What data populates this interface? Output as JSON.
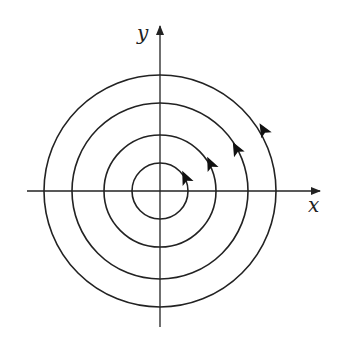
{
  "diagram": {
    "type": "phase-portrait",
    "axes": {
      "x_label": "x",
      "y_label": "y"
    },
    "orbits": [
      {
        "radius": 28,
        "direction": "counterclockwise"
      },
      {
        "radius": 56,
        "direction": "counterclockwise"
      },
      {
        "radius": 88,
        "direction": "counterclockwise"
      },
      {
        "radius": 116,
        "direction": "counterclockwise"
      }
    ],
    "colors": {
      "stroke": "#222222",
      "background": "#ffffff"
    }
  }
}
